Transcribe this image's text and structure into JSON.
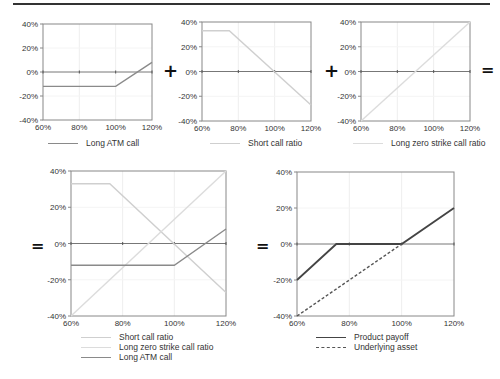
{
  "operators": {
    "plus1": "+",
    "plus2": "+",
    "eq1": "=",
    "eq2": "=",
    "eq3": "="
  },
  "colors": {
    "atm": "#8a8a8a",
    "short": "#cfcfcf",
    "zero": "#dcdcdc",
    "product": "#444444",
    "underlying": "#555555",
    "axis": "#888888",
    "grid": "#eeeeee",
    "zero_line": "#777777"
  },
  "chart_data": [
    {
      "id": "long-atm-call",
      "type": "line",
      "x": [
        60,
        80,
        100,
        120
      ],
      "xticks": [
        "60%",
        "80%",
        "100%",
        "120%"
      ],
      "yticks": [
        "40%",
        "20%",
        "0%",
        "-20%",
        "-40%"
      ],
      "ylim": [
        -40,
        40
      ],
      "xlim": [
        60,
        120
      ],
      "series": [
        {
          "name": "Long ATM call",
          "points": [
            [
              60,
              -12
            ],
            [
              100,
              -12
            ],
            [
              120,
              8
            ]
          ],
          "color": "#8a8a8a",
          "dash": "none"
        }
      ],
      "legend": [
        "Long ATM call"
      ]
    },
    {
      "id": "short-call-ratio",
      "type": "line",
      "xticks": [
        "60%",
        "80%",
        "100%",
        "120%"
      ],
      "yticks": [
        "40%",
        "20%",
        "0%",
        "-20%",
        "-40%"
      ],
      "ylim": [
        -40,
        40
      ],
      "xlim": [
        60,
        120
      ],
      "series": [
        {
          "name": "Short call ratio",
          "points": [
            [
              60,
              33
            ],
            [
              75,
              33
            ],
            [
              120,
              -27
            ]
          ],
          "color": "#cfcfcf",
          "dash": "none"
        }
      ],
      "legend": [
        "Short call ratio"
      ]
    },
    {
      "id": "long-zero-strike-call-ratio",
      "type": "line",
      "xticks": [
        "60%",
        "80%",
        "100%",
        "120%"
      ],
      "yticks": [
        "40%",
        "20%",
        "0%",
        "-20%",
        "-40%"
      ],
      "ylim": [
        -40,
        40
      ],
      "xlim": [
        60,
        120
      ],
      "series": [
        {
          "name": "Long zero strike call ratio",
          "points": [
            [
              60,
              -40
            ],
            [
              120,
              40
            ]
          ],
          "color": "#dcdcdc",
          "dash": "none"
        }
      ],
      "legend": [
        "Long zero strike call ratio"
      ]
    },
    {
      "id": "combined-components",
      "type": "line",
      "xticks": [
        "60%",
        "80%",
        "100%",
        "120%"
      ],
      "yticks": [
        "40%",
        "20%",
        "0%",
        "-20%",
        "-40%"
      ],
      "ylim": [
        -40,
        40
      ],
      "xlim": [
        60,
        120
      ],
      "series": [
        {
          "name": "Short call ratio",
          "points": [
            [
              60,
              33
            ],
            [
              75,
              33
            ],
            [
              120,
              -27
            ]
          ],
          "color": "#cfcfcf",
          "dash": "none"
        },
        {
          "name": "Long zero strike call ratio",
          "points": [
            [
              60,
              -40
            ],
            [
              120,
              40
            ]
          ],
          "color": "#dcdcdc",
          "dash": "none"
        },
        {
          "name": "Long ATM call",
          "points": [
            [
              60,
              -12
            ],
            [
              100,
              -12
            ],
            [
              120,
              8
            ]
          ],
          "color": "#8a8a8a",
          "dash": "none"
        }
      ],
      "legend": [
        "Short call ratio",
        "Long zero strike call ratio",
        "Long ATM call"
      ]
    },
    {
      "id": "product-payoff",
      "type": "line",
      "xticks": [
        "60%",
        "80%",
        "100%",
        "120%"
      ],
      "yticks": [
        "40%",
        "20%",
        "0%",
        "-20%",
        "-40%"
      ],
      "ylim": [
        -40,
        40
      ],
      "xlim": [
        60,
        120
      ],
      "series": [
        {
          "name": "Product payoff",
          "points": [
            [
              60,
              -20
            ],
            [
              75,
              0
            ],
            [
              100,
              0
            ],
            [
              120,
              20
            ]
          ],
          "color": "#444444",
          "dash": "none"
        },
        {
          "name": "Underlying asset",
          "points": [
            [
              60,
              -40
            ],
            [
              100,
              0
            ]
          ],
          "color": "#555555",
          "dash": "3,2"
        }
      ],
      "legend": [
        "Product payoff",
        "Underlying asset"
      ]
    }
  ]
}
